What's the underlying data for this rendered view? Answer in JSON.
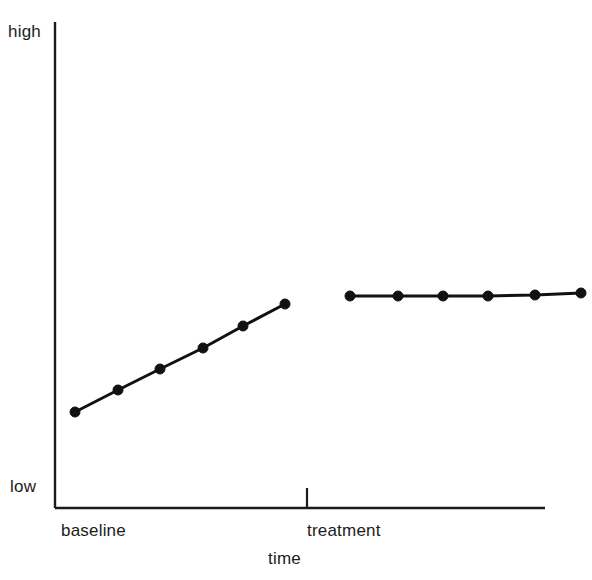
{
  "figure": {
    "background_color": "#ffffff",
    "ink_color": "#1a1a1a"
  },
  "axes": {
    "y_high_label": "high",
    "y_low_label": "low",
    "x_title": "time",
    "y_axis_x": 55,
    "y_axis_top": 22,
    "y_axis_bottom": 508,
    "x_axis_y": 508,
    "x_axis_left": 55,
    "x_axis_right": 545,
    "axis_line_width": 2.4,
    "ticks": "none",
    "grid": "off"
  },
  "phase_divider": {
    "x": 307,
    "top": 488,
    "bottom": 508,
    "line_width": 2.2
  },
  "phase_labels": [
    {
      "label": "baseline",
      "x": 61
    },
    {
      "label": "treatment",
      "x": 307
    }
  ],
  "chart_data": {
    "type": "line",
    "title": "",
    "subtitle": "",
    "xlabel": "time",
    "ylabel": "",
    "ytick_labels": [
      "low",
      "high"
    ],
    "xtick_labels": [
      "baseline",
      "treatment"
    ],
    "grid": false,
    "legend": "none",
    "annotations": [
      "phase change line between baseline and treatment"
    ],
    "axis_pixel_frame": {
      "x_left": 55,
      "x_right": 545,
      "y_top": 22,
      "y_bottom": 508
    },
    "series": [
      {
        "name": "baseline",
        "phase": "baseline",
        "marker": "filled-circle",
        "marker_radius": 5,
        "line_width": 3,
        "color": "#111111",
        "points": [
          {
            "x": 75,
            "y": 412
          },
          {
            "x": 118,
            "y": 390
          },
          {
            "x": 160,
            "y": 369
          },
          {
            "x": 203,
            "y": 348
          },
          {
            "x": 243,
            "y": 326
          },
          {
            "x": 285,
            "y": 304
          }
        ]
      },
      {
        "name": "treatment",
        "phase": "treatment",
        "marker": "filled-circle",
        "marker_radius": 5,
        "line_width": 3,
        "color": "#111111",
        "points": [
          {
            "x": 350,
            "y": 296
          },
          {
            "x": 398,
            "y": 296
          },
          {
            "x": 443,
            "y": 296
          },
          {
            "x": 488,
            "y": 296
          },
          {
            "x": 535,
            "y": 295
          },
          {
            "x": 581,
            "y": 293
          }
        ]
      }
    ]
  }
}
